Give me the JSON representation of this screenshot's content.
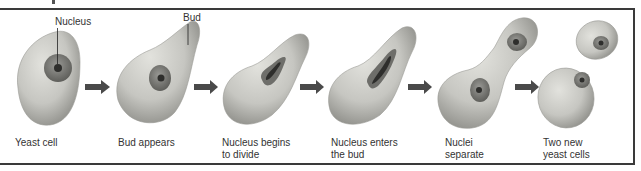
{
  "diagram": {
    "callouts": {
      "nucleus": "Nucleus",
      "bud": "Bud"
    },
    "stages": [
      {
        "line1": "Yeast cell",
        "line2": ""
      },
      {
        "line1": "Bud appears",
        "line2": ""
      },
      {
        "line1": "Nucleus begins",
        "line2": "to divide"
      },
      {
        "line1": "Nucleus enters",
        "line2": "the bud"
      },
      {
        "line1": "Nuclei",
        "line2": "separate"
      },
      {
        "line1": "Two new",
        "line2": "yeast cells"
      }
    ],
    "arrow_count": 5,
    "colors": {
      "cell_fill": "#c9c9c4",
      "cell_shadow": "#8f8f8a",
      "nucleus_outer": "#7c7c78",
      "nucleus_inner": "#3c3c3a",
      "arrow": "#4a4a4a",
      "frame": "#3a3a3a",
      "text": "#333333"
    }
  }
}
